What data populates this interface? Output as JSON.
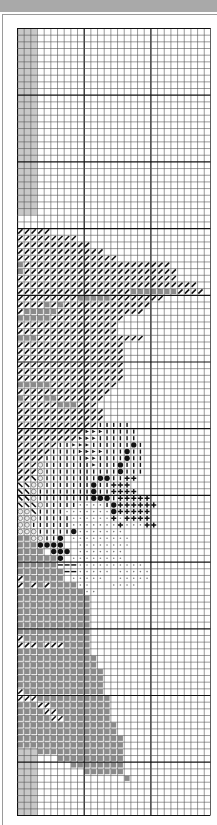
{
  "chart": {
    "title": "",
    "grid": {
      "cols": 29,
      "rows": 118,
      "cell_px": 6.67,
      "major_every": 10,
      "origin_x": 17,
      "origin_y": 28
    },
    "colors": {
      "grid_line": "#555555",
      "major_line": "#111111",
      "shade": "#c8c8c8",
      "gray_square": "#8a8a8a",
      "dark": "#111111",
      "topbar": "#a9a9a9"
    },
    "legend": {
      ".": "empty",
      "/": "diagonal-stitch",
      "#": "gray-square",
      "|": "vertical-bar",
      ">": "triangle",
      "o": "black-dot",
      "+": "plus",
      "c": "circle",
      "\\": "backslash",
      "s": "small-dot",
      "-": "dash"
    },
    "shaded_columns": [
      0,
      1,
      2
    ],
    "shade_row_ranges": [
      [
        0,
        28
      ],
      [
        108,
        118
      ]
    ],
    "rows": [
      ".............................",
      ".............................",
      ".............................",
      ".............................",
      ".............................",
      ".............................",
      ".............................",
      ".............................",
      ".............................",
      ".............................",
      ".............................",
      ".............................",
      ".............................",
      ".............................",
      ".............................",
      ".............................",
      ".............................",
      ".............................",
      ".............................",
      ".............................",
      ".............................",
      ".............................",
      ".............................",
      ".............................",
      ".............................",
      ".............................",
      ".............................",
      ".............................",
      ".............................",
      ".............................",
      "/////........................",
      "/////////....................",
      "///////////..................",
      "/////////////................",
      "///////////////..............",
      "#//////////////////////......",
      "#///////////////////////.....",
      "////////////////////////.....",
      "///////////////////////////..",
      "/////////////////#######////.",
      "/////////#####////////.......",
      "////#/#/////////////.........",
      "/#####/////////////..........",
      "#####///////////.............",
      "///////////////..............",
      "///////////////..............",
      "###////////////////..........",
      "////////////////.............",
      "////////////////.............",
      "////////////////.............",
      "////////////////.............",
      "////////////////.............",
      "////////////////.............",
      "#####//////////..............",
      "//////////////...............",
      "#///##///////................",
      "//////###///.................",
      "/////////////................",
      "/////////////................",
      "////////////|||||............",
      "//////////>>>|||||...........",
      "/////////>>>||||||...........",
      "//////||>>>||||||o|..........",
      "/////||||>>>>|||o||..........",
      "////||||||>>||||o||..........",
      "///c|||||||>|||o|||..........",
      "///c|||||||||||o|||..........",
      "//\\c||||||||oo||++...........",
      "\\\\cc|||||||o||+++...........",
      "\\\\c||||||||o||++++..........",
      "\\\\c||||||||ooo|+++++........",
      "\\\\\\c|||||ssss|o++++++.......",
      "cc\\||||ssssssso+++++........",
      "ccc|||||ssssss+s++++.........",
      "cc||||||sssssss+sss++........",
      "ccc|||||osssssss.............",
      "##cc||o.sssssssss............",
      "###oooo..ssssssss............",
      "####.ooo.sssssss.............",
      "######o.ssssssss.............",
      "######---ssssssssss..........",
      "#######--sssss.sssss.........",
      "/######.sssss..sssss.........",
      "/#/#/####ss...ssss...........",
      "##########ss.................",
      "###########..................",
      "###########..................",
      "###########..................",
      "###########..................",
      "###########..................",
      "###########..................",
      "/##########..................",
      "///#///####..................",
      "###########..................",
      "############.................",
      "############.................",
      "#############................",
      "#############................",
      "#############................",
      "/############................",
      "///###########...............",
      "###//#########...............",
      "####//########...............",
      "#####//#######...............",
      "###############..............",
      "###############..............",
      "################.............",
      "################.............",
      "...#############.............",
      "......##########.............",
      "........########.............",
      "..........######.............",
      "................#............",
      "..............................",
      ".............................",
      ".............................",
      ".............................",
      "............................."
    ]
  }
}
